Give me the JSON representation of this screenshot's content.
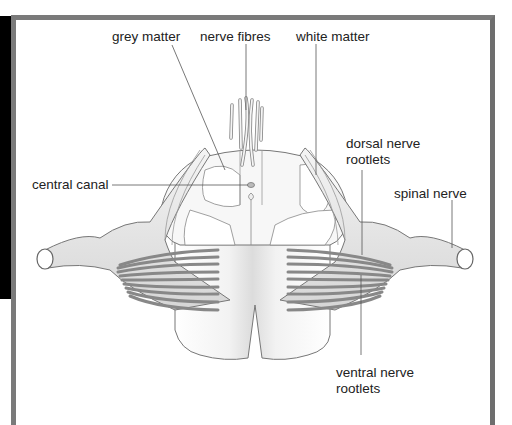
{
  "diagram": {
    "labels": {
      "grey_matter": "grey matter",
      "nerve_fibres": "nerve fibres",
      "white_matter": "white matter",
      "central_canal": "central canal",
      "dorsal_nerve_rootlets_line1": "dorsal nerve",
      "dorsal_nerve_rootlets_line2": "rootlets",
      "spinal_nerve": "spinal nerve",
      "ventral_nerve_rootlets_line1": "ventral nerve",
      "ventral_nerve_rootlets_line2": "rootlets"
    },
    "colors": {
      "frame_border": "#7a7a7a",
      "outline": "#777777",
      "fill_light": "#ededed",
      "fill_mid": "#d9d9d9",
      "label_text": "#222222",
      "leader_line": "#555555"
    }
  }
}
